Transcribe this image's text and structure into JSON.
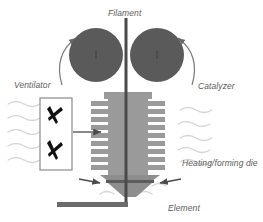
{
  "diagram": {
    "type": "process-schematic",
    "width": 263,
    "height": 222,
    "background": "#ffffff",
    "labels": {
      "filament": "Filament",
      "ventilator": "Ventilator",
      "catalyzer": "Catalyzer",
      "heating_forming_die": "Heating/forming die",
      "element": "Element"
    },
    "colors": {
      "roller_fill": "#5a5a5a",
      "die_body": "#9a9a9a",
      "die_fin": "#9a9a9a",
      "funnel": "#8e8e8e",
      "filament_line": "#4a4a4a",
      "element_bar": "#6b6b6b",
      "wave_line": "#d2d2d2",
      "arrow": "#4a4a4a",
      "fan_blade": "#111111",
      "fan_box_border": "#7a7a7a",
      "label_text": "#5b5b5b"
    },
    "components": {
      "rollers": {
        "name": "catalyzer-rollers",
        "count": 2,
        "radius": 27,
        "left_center": [
          96,
          55
        ],
        "right_center": [
          156,
          55
        ],
        "rotation_arrows": 2
      },
      "filament": {
        "name": "filament-line",
        "x": 126,
        "top": 18,
        "bottom": 207,
        "width": 3
      },
      "heating_die": {
        "name": "heating-forming-die",
        "body_x": 108,
        "body_y": 95,
        "body_width": 38,
        "body_height": 80,
        "fin_rows": 9,
        "fin_width": 18,
        "fin_height": 4
      },
      "funnel": {
        "name": "forming-funnel",
        "top_y": 175,
        "bottom_y": 196
      },
      "ventilator_box": {
        "name": "ventilator-fan-box",
        "x": 40,
        "y": 98,
        "width": 32,
        "height": 72,
        "blade_count": 2
      },
      "element_bar": {
        "name": "element-bar",
        "x1": 57,
        "x2": 128,
        "y": 204,
        "thickness": 5
      },
      "wave_lines": {
        "name": "airflow-waves",
        "left_count": 5,
        "right_count": 5
      },
      "inward_arrows": {
        "name": "die-inlet-arrows",
        "count": 2
      },
      "airflow_arrow": {
        "name": "ventilator-airflow-arrow",
        "from_x": 74,
        "to_x": 104,
        "y": 132
      }
    }
  }
}
